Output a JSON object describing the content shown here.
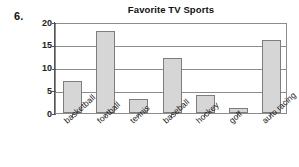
{
  "worksheet": {
    "item_number": "6."
  },
  "chart_data": {
    "type": "bar",
    "title": "Favorite TV Sports",
    "xlabel": "",
    "ylabel": "",
    "categories": [
      "basketball",
      "football",
      "tennis",
      "baseball",
      "hockey",
      "golf",
      "auto racing"
    ],
    "values": [
      7,
      18,
      3,
      12,
      4,
      1,
      16
    ],
    "ylim": [
      0,
      20
    ],
    "yticks": [
      0,
      5,
      10,
      15,
      20
    ],
    "ytick_labels": [
      "0",
      "5",
      "10",
      "15",
      "20"
    ],
    "grid": true,
    "grid_axis": "y",
    "legend": false,
    "colors": {
      "bar_fill": "#d6d6d6",
      "bar_border": "#7d7d7d",
      "gridline": "#8c8c8c",
      "axis": "#555555",
      "text": "#1a1a1a",
      "background": "#ffffff"
    }
  }
}
